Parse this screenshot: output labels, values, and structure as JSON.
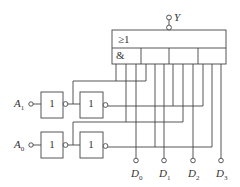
{
  "diagram": {
    "type": "logic-circuit",
    "output": {
      "label": "Y"
    },
    "aoi_gate": {
      "or_symbol": "≥1",
      "and_symbol": "&",
      "and_sections": 4
    },
    "inputs": [
      {
        "label": "A",
        "sub": "1"
      },
      {
        "label": "A",
        "sub": "0"
      }
    ],
    "inverter_symbol": "1",
    "data_inputs": [
      {
        "label": "D",
        "sub": "0"
      },
      {
        "label": "D",
        "sub": "1"
      },
      {
        "label": "D",
        "sub": "2"
      },
      {
        "label": "D",
        "sub": "3"
      }
    ],
    "colors": {
      "stroke": "#444444",
      "background": "#ffffff"
    }
  }
}
